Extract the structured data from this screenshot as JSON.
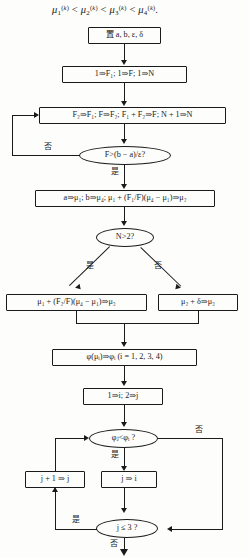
{
  "document": {
    "type": "flowchart",
    "language": "zh",
    "title_formula": "μ₁⁽ᵏ⁾ < μ₂⁽ᵏ⁾ < μ₃⁽ᵏ⁾ < μ₄⁽ᵏ⁾."
  },
  "labels": {
    "yes": "是",
    "no": "否"
  },
  "nodes": {
    "set_params": {
      "shape": "process",
      "text": "置 a, b, ε, δ"
    },
    "init_fib": {
      "shape": "process",
      "text": "1⇒F₁; 1⇒F; 1⇒N"
    },
    "fib_step": {
      "shape": "process",
      "text": "F₂⇒F₁; F⇒F₂; F₁ + F₂⇒F; N + 1⇒N"
    },
    "check_f": {
      "shape": "decision",
      "text": "F>(b − a)/ε?"
    },
    "assign_mu": {
      "shape": "process",
      "text": "a⇒μ₁; b⇒μ₄; μ₁ + (F₁/F)(μ₄ − μ₁)⇒μ₂"
    },
    "check_n": {
      "shape": "decision",
      "text": "N>2?"
    },
    "mu3_fib": {
      "shape": "process",
      "text": "μ₁ + (F₂/F)(μ₄ − μ₁)⇒μ₃"
    },
    "mu3_delta": {
      "shape": "process",
      "text": "μ₂ + δ⇒μ₃"
    },
    "eval_phi": {
      "shape": "process",
      "text": "φ(μᵢ)⇒φᵢ (i = 1, 2, 3, 4)"
    },
    "init_ij": {
      "shape": "process",
      "text": "1⇒i; 2⇒j"
    },
    "compare_phi": {
      "shape": "decision",
      "text": "φⱼ<φᵢ ?"
    },
    "incr_j": {
      "shape": "process",
      "text": "j + 1 ⇒ j"
    },
    "j_to_i": {
      "shape": "process",
      "text": "j ⇒ i"
    },
    "check_j": {
      "shape": "decision",
      "text": "j ≤ 3 ?"
    }
  },
  "edges": {
    "check_f_no": "否",
    "check_f_yes": "是",
    "check_n_yes": "是",
    "check_n_no": "否",
    "compare_phi_yes": "是",
    "compare_phi_no": "否",
    "check_j_yes": "是",
    "check_j_no": "否"
  },
  "colors": {
    "ink": "#1a1a1a",
    "paper": "#fdfdfb"
  }
}
